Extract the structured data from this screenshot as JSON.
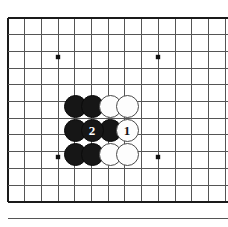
{
  "diagram": {
    "type": "go-board-diagram",
    "board": {
      "background_color": "#ffffff",
      "line_color": "#555555",
      "border_color": "#1a1a1a",
      "star_point_color": "#111111",
      "columns_visible": 13,
      "rows_visible": 12,
      "left_px": 8,
      "top_px": 18,
      "spacing_px": 16.7,
      "border_left": true,
      "border_top": true,
      "border_bottom": true,
      "border_right": false
    },
    "star_points": [
      {
        "x": 58,
        "y": 57
      },
      {
        "x": 158,
        "y": 57
      },
      {
        "x": 58,
        "y": 157
      },
      {
        "x": 158,
        "y": 157
      }
    ],
    "stone_radius_px": 11.5,
    "stones": [
      {
        "id": "b-r1-c1",
        "color": "black",
        "label": "",
        "x": 75,
        "y": 106
      },
      {
        "id": "b-r1-c2",
        "color": "black",
        "label": "",
        "x": 92,
        "y": 106
      },
      {
        "id": "w-r1-c3",
        "color": "white",
        "label": "",
        "x": 110,
        "y": 106
      },
      {
        "id": "w-r1-c4",
        "color": "white",
        "label": "",
        "x": 127,
        "y": 106
      },
      {
        "id": "b-r2-c1",
        "color": "black",
        "label": "",
        "x": 75,
        "y": 130
      },
      {
        "id": "b-r2-c2",
        "color": "black",
        "label": "2",
        "x": 92,
        "y": 130
      },
      {
        "id": "b-r2-c3",
        "color": "black",
        "label": "",
        "x": 110,
        "y": 130
      },
      {
        "id": "w-r2-c4",
        "color": "white",
        "label": "1",
        "x": 127,
        "y": 130
      },
      {
        "id": "b-r3-c1",
        "color": "black",
        "label": "",
        "x": 75,
        "y": 154
      },
      {
        "id": "b-r3-c2",
        "color": "black",
        "label": "",
        "x": 92,
        "y": 154
      },
      {
        "id": "w-r3-c3",
        "color": "white",
        "label": "",
        "x": 110,
        "y": 154
      },
      {
        "id": "w-r3-c4",
        "color": "white",
        "label": "",
        "x": 127,
        "y": 154
      }
    ],
    "move_labels": [
      {
        "number": "1",
        "color": "white"
      },
      {
        "number": "2",
        "color": "black"
      }
    ]
  }
}
